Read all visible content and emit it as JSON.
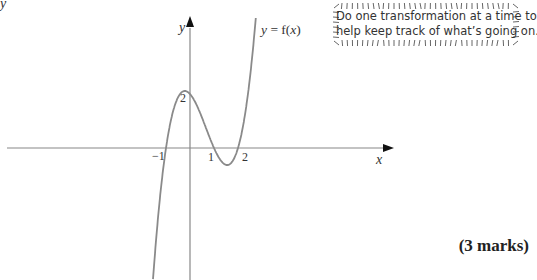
{
  "question": {
    "part_label": "y",
    "marks": "(3 marks)"
  },
  "hint": {
    "lines": [
      "Do one transformation at a time to",
      "help keep track of what’s going on."
    ]
  },
  "graph": {
    "x_axis_label": "x",
    "y_axis_label": "y",
    "curve_label": "y = f(x)",
    "tick_labels": {
      "x_neg1": "−1",
      "x_1": "1",
      "x_2": "2",
      "y_2": "2"
    },
    "colors": {
      "axis": "#888888",
      "curve": "#8a8a8a",
      "text": "#222222",
      "hint_border": "#555555"
    }
  },
  "chart_data": {
    "type": "line",
    "title": "",
    "xlabel": "x",
    "ylabel": "y",
    "series": [
      {
        "name": "y = f(x)",
        "description": "cubic with roots at x = -1, 1, 2 and y-intercept 2; local max near (-0.2, 2.1), local min near (1.55, -0.6)",
        "x": [
          -1.55,
          -1,
          -0.5,
          -0.2,
          0,
          0.5,
          1,
          1.5,
          2,
          2.5,
          2.78
        ],
        "y": [
          -4.9,
          0,
          1.9,
          2.1,
          2,
          1.1,
          0,
          -0.6,
          0,
          2.6,
          4.9
        ]
      }
    ],
    "key_points": [
      {
        "label": "−1",
        "x": -1,
        "y": 0
      },
      {
        "label": "1",
        "x": 1,
        "y": 0
      },
      {
        "label": "2",
        "x": 2,
        "y": 0
      },
      {
        "label": "2",
        "x": 0,
        "y": 2
      }
    ],
    "grid": false,
    "legend": "none"
  }
}
